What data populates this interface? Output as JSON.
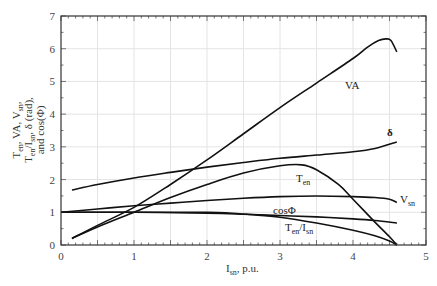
{
  "chart_data": {
    "type": "line",
    "title": "",
    "xlabel": "I_sn, p.u.",
    "ylabel": "T_en, VA, V_sn, T_en/I_sn, δ (rad), and cos(Φ)",
    "xlim": [
      0,
      5
    ],
    "ylim": [
      0,
      7
    ],
    "xticks": [
      0,
      1,
      2,
      3,
      4,
      5
    ],
    "yticks": [
      0,
      1,
      2,
      3,
      4,
      5,
      6,
      7
    ],
    "grid": true,
    "legend": "inline labels",
    "series": [
      {
        "name": "VA",
        "label_pos": [
          3.9,
          5.5
        ],
        "x": [
          0.15,
          0.5,
          1.0,
          1.5,
          2.0,
          2.5,
          3.0,
          3.5,
          4.0,
          4.2,
          4.35,
          4.45,
          4.52,
          4.6
        ],
        "y": [
          0.2,
          0.6,
          1.15,
          1.85,
          2.6,
          3.4,
          4.2,
          4.95,
          5.7,
          6.05,
          6.25,
          6.3,
          6.25,
          5.9
        ]
      },
      {
        "name": "δ",
        "label_pos": [
          4.45,
          3.3
        ],
        "x": [
          0.15,
          0.5,
          1.0,
          1.5,
          2.0,
          2.5,
          3.0,
          3.5,
          4.0,
          4.3,
          4.6
        ],
        "y": [
          1.68,
          1.85,
          2.05,
          2.22,
          2.38,
          2.52,
          2.65,
          2.75,
          2.85,
          2.95,
          3.15
        ]
      },
      {
        "name": "T_en",
        "label_pos": [
          3.15,
          1.95
        ],
        "x": [
          0.15,
          0.5,
          1.0,
          1.5,
          2.0,
          2.5,
          3.0,
          3.3,
          3.5,
          3.8,
          4.0,
          4.3,
          4.5,
          4.6
        ],
        "y": [
          0.2,
          0.55,
          1.0,
          1.45,
          1.85,
          2.2,
          2.42,
          2.45,
          2.3,
          1.85,
          1.4,
          0.7,
          0.25,
          0.0
        ]
      },
      {
        "name": "V_sn",
        "label_pos": [
          4.65,
          1.35
        ],
        "x": [
          0.0,
          0.5,
          1.0,
          1.5,
          2.0,
          2.5,
          3.0,
          3.5,
          4.0,
          4.3,
          4.5,
          4.6
        ],
        "y": [
          1.0,
          1.1,
          1.2,
          1.28,
          1.36,
          1.43,
          1.48,
          1.5,
          1.48,
          1.45,
          1.4,
          1.3
        ]
      },
      {
        "name": "cosΦ",
        "label_pos": [
          3.0,
          0.98
        ],
        "x": [
          0.0,
          1.0,
          2.0,
          2.5,
          3.0,
          3.5,
          4.0,
          4.3,
          4.6
        ],
        "y": [
          1.0,
          1.0,
          0.97,
          0.94,
          0.9,
          0.86,
          0.8,
          0.75,
          0.67
        ]
      },
      {
        "name": "T_en/I_sn",
        "label_pos": [
          3.0,
          0.42
        ],
        "x": [
          0.0,
          1.0,
          2.0,
          2.3,
          2.6,
          3.0,
          3.5,
          4.0,
          4.3,
          4.5,
          4.6
        ],
        "y": [
          1.0,
          1.0,
          1.0,
          0.98,
          0.93,
          0.85,
          0.67,
          0.45,
          0.28,
          0.12,
          0.0
        ]
      }
    ]
  },
  "labels": {
    "x_axis_title_main": "I",
    "x_axis_title_sub": "sn",
    "x_axis_title_tail": ", p.u.",
    "y_axis_line1": "T",
    "y_axis_line1_sub": "en",
    "y_axis_line1_tail": ", VA, V",
    "y_axis_line1_sub2": "sn",
    "y_axis_line1_end": ",",
    "y_axis_line2": "T",
    "y_axis_line2_sub": "en",
    "y_axis_line2_mid": "/I",
    "y_axis_line2_sub2": "sn",
    "y_axis_line2_tail": ", δ (rad),",
    "y_axis_line3": "and cos(Φ)",
    "curve_VA": "VA",
    "curve_delta": "δ",
    "curve_Ten": "T",
    "curve_Ten_sub": "en",
    "curve_Vsn": "V",
    "curve_Vsn_sub": "sn",
    "curve_cos": "cosΦ",
    "curve_ratio_a": "T",
    "curve_ratio_a_sub": "en",
    "curve_ratio_b": "/I",
    "curve_ratio_b_sub": "sn"
  }
}
